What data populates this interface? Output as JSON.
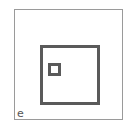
{
  "figure": {
    "label": "e",
    "shapes": [
      {
        "name": "outer-frame",
        "type": "square",
        "stroke": "#9a9a9a"
      },
      {
        "name": "large-square",
        "type": "square",
        "stroke": "#5a5a5a"
      },
      {
        "name": "small-square",
        "type": "square",
        "stroke": "#5a5a5a"
      }
    ]
  }
}
